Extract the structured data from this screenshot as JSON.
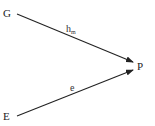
{
  "diagram": {
    "nodes": [
      {
        "id": "G",
        "label": "G",
        "x": 3,
        "y": 17
      },
      {
        "id": "E",
        "label": "E",
        "x": 3,
        "y": 120
      },
      {
        "id": "P",
        "label": "P",
        "x": 137,
        "y": 70
      }
    ],
    "edges": [
      {
        "from": "G",
        "to": "P",
        "label": "h",
        "label_sub": "m"
      },
      {
        "from": "E",
        "to": "P",
        "label": "e",
        "label_sub": ""
      }
    ],
    "colors": {
      "line": "#222222",
      "text": "#222222"
    }
  }
}
